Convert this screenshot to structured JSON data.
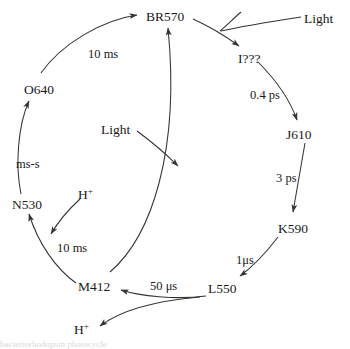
{
  "figure": {
    "stroke_color": "#333333",
    "background_color": "#ffffff",
    "text_color": "#1a1a1a"
  },
  "nodes": [
    {
      "id": "br570",
      "label": "BR570",
      "x": 146,
      "y": 10
    },
    {
      "id": "i",
      "label": "I???",
      "x": 238,
      "y": 52
    },
    {
      "id": "j610",
      "label": "J610",
      "x": 286,
      "y": 128
    },
    {
      "id": "k590",
      "label": "K590",
      "x": 278,
      "y": 222
    },
    {
      "id": "l550",
      "label": "L550",
      "x": 208,
      "y": 282
    },
    {
      "id": "m412",
      "label": "M412",
      "x": 78,
      "y": 280
    },
    {
      "id": "n530",
      "label": "N530",
      "x": 12,
      "y": 198
    },
    {
      "id": "o640",
      "label": "O640",
      "x": 24,
      "y": 83
    }
  ],
  "rates": [
    {
      "id": "br-to-o",
      "label": "10 ms",
      "x": 88,
      "y": 48
    },
    {
      "id": "i-to-j",
      "label": "0.4 ps",
      "x": 250,
      "y": 89
    },
    {
      "id": "j-to-k",
      "label": "3 ps",
      "x": 276,
      "y": 172
    },
    {
      "id": "k-to-l",
      "label": "1μs",
      "x": 236,
      "y": 254
    },
    {
      "id": "l-to-m",
      "label": "50 μs",
      "x": 150,
      "y": 280
    },
    {
      "id": "m-to-n",
      "label": "10 ms",
      "x": 57,
      "y": 242
    },
    {
      "id": "n-to-o",
      "label": "ms-s",
      "x": 16,
      "y": 158
    }
  ],
  "aux": [
    {
      "id": "light-top",
      "label": "Light",
      "x": 304,
      "y": 12
    },
    {
      "id": "light-center",
      "label": "Light",
      "x": 101,
      "y": 123
    },
    {
      "id": "proton-in",
      "label": "H",
      "sup": "+",
      "x": 78,
      "y": 188
    },
    {
      "id": "proton-out",
      "label": "H",
      "sup": "+",
      "x": 74,
      "y": 323
    }
  ],
  "caption": {
    "text": "bacteriorhodopsin photocycle"
  }
}
